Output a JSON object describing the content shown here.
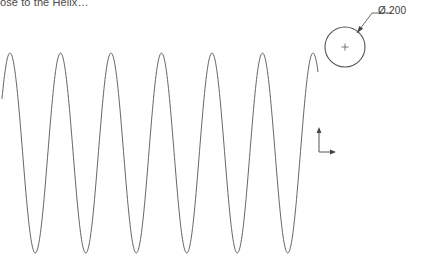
{
  "canvas": {
    "width": 422,
    "height": 266,
    "background": "#ffffff",
    "stroke_color": "#555555",
    "text_color": "#4a4a4a"
  },
  "caption": {
    "text": "ose to the Helix…",
    "note": "clipped heading text at top-left edge"
  },
  "dimension": {
    "label": "Ø.200",
    "symbol": "diameter",
    "value": ".200"
  },
  "circle": {
    "center_x": 345,
    "center_y": 47,
    "radius": 20,
    "center_mark": "cross"
  },
  "leader": {
    "arrow_x": 357,
    "arrow_y": 33,
    "elbow_x": 372,
    "elbow_y": 13,
    "shoulder_x": 392,
    "shoulder_y": 13
  },
  "axis_triad": {
    "origin_x": 319,
    "origin_y": 152,
    "vertical_len": 22,
    "horizontal_len": 14,
    "labels": []
  },
  "chart_data": {
    "type": "line",
    "title": "",
    "xlabel": "",
    "ylabel": "",
    "grid": false,
    "legend": null,
    "stroke_color": "#555555",
    "stroke_width": 0.9,
    "xlim": [
      0,
      318
    ],
    "ylim": [
      266,
      0
    ],
    "amplitude": 100,
    "midline_y": 153,
    "wavelength": 50.5,
    "phase_start_x": 10,
    "peak_y": 53,
    "trough_y": 253,
    "peaks_x": [
      10,
      60,
      111,
      162,
      212,
      263,
      313
    ],
    "troughs_x": [
      35,
      86,
      136,
      187,
      238,
      288
    ],
    "x_start": 2,
    "x_end": 318,
    "cycles": 6.2
  }
}
